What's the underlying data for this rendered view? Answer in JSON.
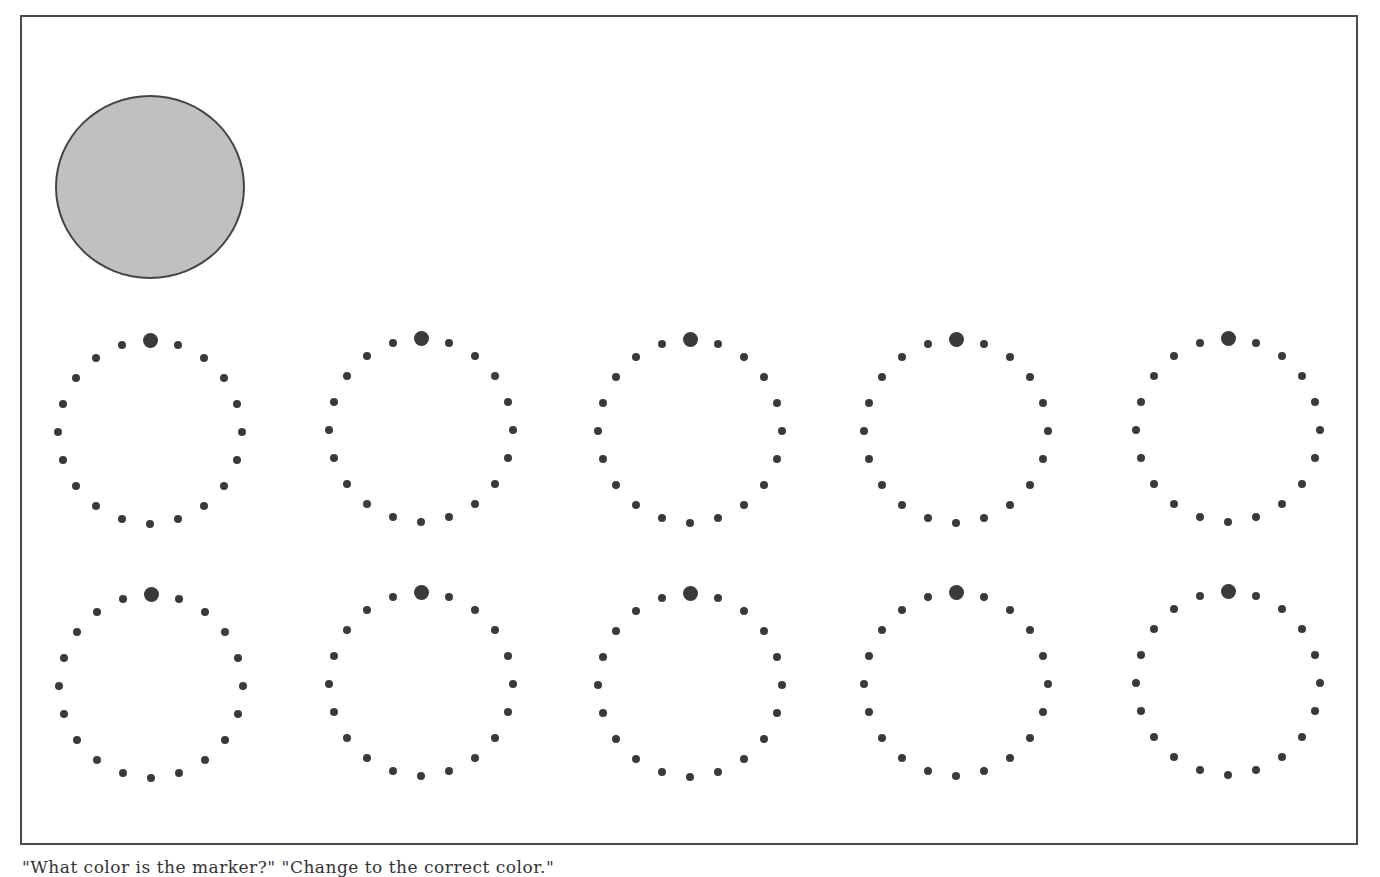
{
  "caption": "\"What color is the marker?\" \"Change to the correct color.\"",
  "colors": {
    "frame_border": "#4a4a4a",
    "big_circle_fill": "#c0c0c0",
    "big_circle_border": "#444444",
    "dot": "#3a3a3a",
    "background": "#ffffff"
  },
  "big_circle": {
    "cx": 150,
    "cy": 187,
    "rx": 95,
    "ry": 92
  },
  "ring_config": {
    "dots_per_ring": 20,
    "radius_x": 92,
    "radius_y": 92,
    "small_dot_diameter": 8,
    "marker_dot_diameter": 15,
    "marker_index": 0
  },
  "rings": [
    {
      "row": 1,
      "col": 1,
      "cx": 150,
      "cy": 432
    },
    {
      "row": 1,
      "col": 2,
      "cx": 421,
      "cy": 430
    },
    {
      "row": 1,
      "col": 3,
      "cx": 690,
      "cy": 431
    },
    {
      "row": 1,
      "col": 4,
      "cx": 956,
      "cy": 431
    },
    {
      "row": 1,
      "col": 5,
      "cx": 1228,
      "cy": 430
    },
    {
      "row": 2,
      "col": 1,
      "cx": 151,
      "cy": 686
    },
    {
      "row": 2,
      "col": 2,
      "cx": 421,
      "cy": 684
    },
    {
      "row": 2,
      "col": 3,
      "cx": 690,
      "cy": 685
    },
    {
      "row": 2,
      "col": 4,
      "cx": 956,
      "cy": 684
    },
    {
      "row": 2,
      "col": 5,
      "cx": 1228,
      "cy": 683
    }
  ]
}
